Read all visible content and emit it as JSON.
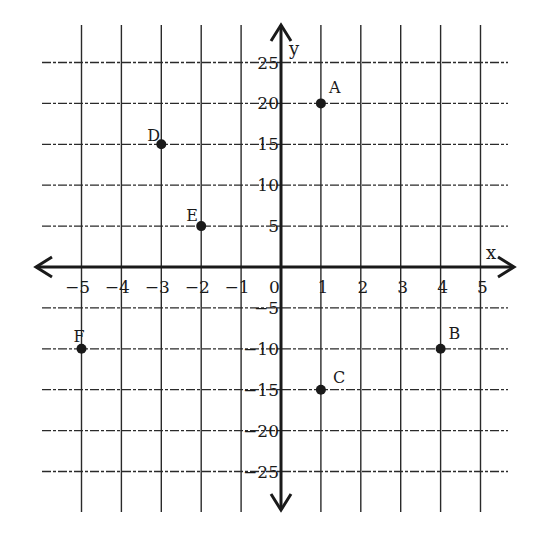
{
  "chart_data": {
    "type": "scatter",
    "title": "",
    "xlabel": "x",
    "ylabel": "y",
    "xlim": [
      -5,
      5
    ],
    "ylim": [
      -25,
      25
    ],
    "grid": true,
    "x_ticks": [
      -5,
      -4,
      -3,
      -2,
      -1,
      0,
      1,
      2,
      3,
      4,
      5
    ],
    "x_tick_labels": [
      "−5",
      "−4",
      "−3",
      "−2",
      "−1",
      "0",
      "1",
      "2",
      "3",
      "4",
      "5"
    ],
    "y_ticks": [
      25,
      20,
      15,
      10,
      5,
      -5,
      -10,
      -15,
      -20,
      -25
    ],
    "y_tick_labels": [
      "25",
      "20",
      "15",
      "10",
      "5",
      "−5",
      "−10",
      "−15",
      "−20",
      "−25"
    ],
    "points": [
      {
        "label": "A",
        "x": 1,
        "y": 20
      },
      {
        "label": "B",
        "x": 4,
        "y": -10
      },
      {
        "label": "C",
        "x": 1,
        "y": -15
      },
      {
        "label": "D",
        "x": -3,
        "y": 15
      },
      {
        "label": "E",
        "x": -2,
        "y": 5
      },
      {
        "label": "F",
        "x": -5,
        "y": -10
      }
    ]
  },
  "colors": {
    "ink": "#1a1a1a",
    "grid": "#2a2a2a",
    "background": "#ffffff"
  }
}
